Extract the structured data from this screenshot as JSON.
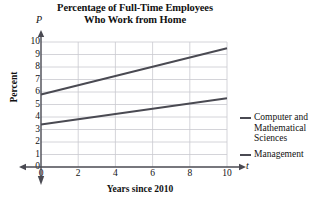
{
  "chart_data": {
    "type": "line",
    "title": "Percentage of Full-Time Employees Who Work from Home",
    "title_line1": "Percentage of Full-Time Employees",
    "title_line2": "Who Work from Home",
    "xlabel": "Years since 2010",
    "ylabel": "Percent",
    "x_var": "t",
    "y_var": "P",
    "xlim": [
      0,
      10
    ],
    "ylim": [
      0,
      10
    ],
    "xticks": [
      0,
      2,
      4,
      6,
      8,
      10
    ],
    "xtick_labels": [
      "0",
      "2",
      "4",
      "6",
      "8",
      "10"
    ],
    "yticks": [
      0,
      1,
      2,
      3,
      4,
      5,
      6,
      7,
      8,
      9,
      10
    ],
    "ytick_labels": [
      "0",
      "1",
      "2",
      "3",
      "4",
      "5",
      "6",
      "7",
      "8",
      "9",
      "10"
    ],
    "grid": true,
    "grid_color": "#c9c9cf",
    "legend_position": "right",
    "line_color": "#4a4a52",
    "x": [
      0,
      10
    ],
    "series": [
      {
        "name": "Computer and Mathematical Sciences",
        "legend_lines": [
          "Computer and",
          "Mathematical",
          "Sciences"
        ],
        "values": [
          5.8,
          9.5
        ],
        "color": "#4a4a52"
      },
      {
        "name": "Management",
        "legend_lines": [
          "Management"
        ],
        "values": [
          3.4,
          5.5
        ],
        "color": "#4a4a52"
      }
    ]
  }
}
